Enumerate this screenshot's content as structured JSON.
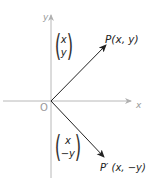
{
  "diagram": {
    "type": "reflection-in-x-axis",
    "axes": {
      "x_label": "x",
      "y_label": "y",
      "origin_label": "O",
      "axis_color": "#b0b0b0"
    },
    "points": {
      "P": {
        "label": "P(x, y)",
        "vector": {
          "top": "x",
          "bottom": "y"
        }
      },
      "P_prime": {
        "label": "P′ (x, −y)",
        "vector": {
          "top": "x",
          "bottom": "−y"
        }
      }
    },
    "arrow_color": "#222222"
  }
}
